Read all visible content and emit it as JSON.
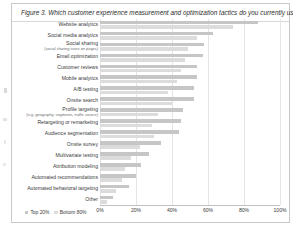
{
  "figure": {
    "title": "Figure 3. Which customer experience measurement and optimization tactics do you currently use?"
  },
  "legend": {
    "items": [
      {
        "label": "Top 20%",
        "color": "#c6c6c6"
      },
      {
        "label": "Bottom 80%",
        "color": "#dcdcdc"
      }
    ]
  },
  "axis": {
    "ticks": [
      "0%",
      "20%",
      "40%",
      "60%",
      "80%",
      "100%"
    ]
  },
  "chart_data": {
    "type": "bar",
    "orientation": "horizontal",
    "title": "Figure 3. Which customer experience measurement and optimization tactics do you currently use?",
    "xlabel": "",
    "ylabel": "",
    "xlim": [
      0,
      100
    ],
    "grid": true,
    "legend_position": "bottom-left",
    "categories": [
      "Website analytics",
      "Social media analytics",
      "Social sharing",
      "Email optimization",
      "Customer reviews",
      "Mobile analytics",
      "A/B testing",
      "Onsite search",
      "Profile targeting",
      "Retargeting or remarketing",
      "Audience segmentation",
      "Onsite survey",
      "Multivariate testing",
      "Attribution modeling",
      "Automated recommendations",
      "Automated behavioral targeting",
      "Other"
    ],
    "category_sublabels": {
      "Social sharing": "(social sharing icons on pages)",
      "Profile targeting": "(e.g. geography, segments, traffic source)"
    },
    "series": [
      {
        "name": "Top 20%",
        "color": "#c6c6c6",
        "values": [
          88,
          63,
          58,
          57,
          54,
          54,
          52,
          52,
          46,
          45,
          44,
          34,
          27,
          23,
          20,
          16,
          7
        ]
      },
      {
        "name": "Bottom 80%",
        "color": "#dcdcdc",
        "values": [
          74,
          54,
          49,
          47,
          45,
          43,
          38,
          40,
          32,
          29,
          30,
          22,
          17,
          14,
          12,
          9,
          4
        ]
      }
    ]
  }
}
